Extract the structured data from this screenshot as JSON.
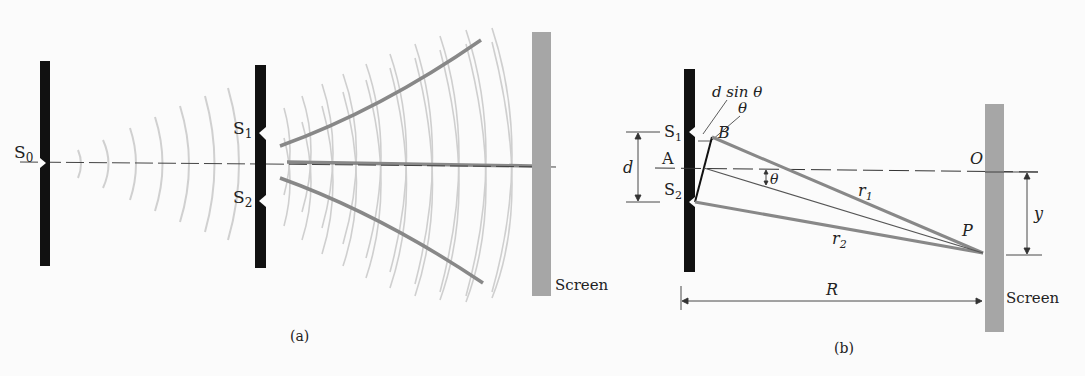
{
  "figure_a": {
    "caption": "(a)",
    "labels": {
      "s0": "S",
      "s0_sub": "0",
      "s1": "S",
      "s1_sub": "1",
      "s2": "S",
      "s2_sub": "2",
      "screen": "Screen"
    }
  },
  "figure_b": {
    "caption": "(b)",
    "labels": {
      "dsin": "d sin θ",
      "theta_top": "θ",
      "theta_mid": "θ",
      "s1": "S",
      "s1_sub": "1",
      "s2": "S",
      "s2_sub": "2",
      "b": "B",
      "a": "A",
      "d": "d",
      "o": "O",
      "p": "P",
      "r1": "r",
      "r1_sub": "1",
      "r2": "r",
      "r2_sub": "2",
      "y": "y",
      "R": "R",
      "screen": "Screen"
    }
  },
  "colors": {
    "barrier": "#111111",
    "screen": "#a6a6a6",
    "wave": "#cfcfcf",
    "ray": "#8a8a8a",
    "line": "#333333"
  }
}
